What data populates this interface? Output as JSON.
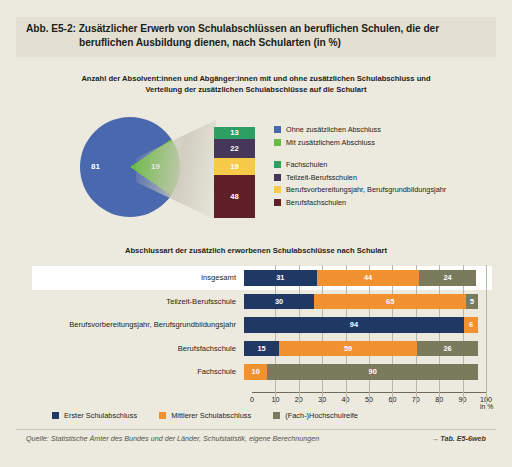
{
  "figure": {
    "label": "Abb. E5-2:",
    "title_line1": "Zusätzlicher Erwerb von Schulabschlüssen an beruflichen Schulen, die der",
    "title_line2": "beruflichen Ausbildung dienen, nach Schularten (in %)"
  },
  "upper": {
    "subtitle_line1": "Anzahl der Absolvent:innen und Abgänger:innen mit und ohne zusätzlichen Schulabschluss und",
    "subtitle_line2": "Verteilung der zusätzlichen Schulabschlüsse auf die Schulart",
    "legend": [
      {
        "label": "Ohne zusätzlichen Abschluss",
        "color": "#4a68ad"
      },
      {
        "label": "Mit zusätzlichem Abschluss",
        "color": "#6aba44"
      },
      {
        "label": "Fachschulen",
        "color": "#2f9e63"
      },
      {
        "label": "Teilzeit-Berufsschulen",
        "color": "#46375a"
      },
      {
        "label": "Berufsvorbereitungsjahr, Berufsgrundbildungsjahr",
        "color": "#f7c948"
      },
      {
        "label": "Berufsfachschulen",
        "color": "#5e1f28"
      }
    ]
  },
  "lower": {
    "subtitle": "Abschlussart der zusätzlich erworbenen Schulabschlüsse nach Schulart",
    "axis_unit": "in %",
    "legend": [
      {
        "label": "Erster Schulabschluss",
        "color": "#203864"
      },
      {
        "label": "Mittlerer Schulabschluss",
        "color": "#f2912f"
      },
      {
        "label": "(Fach-)Hochschulreife",
        "color": "#7a7a5c"
      }
    ]
  },
  "footer": {
    "source": "Quelle: Statistische Ämter des Bundes und der Länder, Schulstatistik, eigene Berechnungen",
    "table_ref": "→ Tab. E5-6web"
  },
  "chart_data": [
    {
      "type": "pie",
      "title": "Anzahl der Absolvent:innen und Abgänger:innen mit und ohne zusätzlichen Schulabschluss",
      "categories": [
        "Ohne zusätzlichen Abschluss",
        "Mit zusätzlichem Abschluss"
      ],
      "values": [
        81,
        19
      ],
      "colors": [
        "#4a68ad",
        "#6aba44"
      ],
      "unit": "%"
    },
    {
      "type": "bar",
      "orientation": "vertical-stacked",
      "title": "Verteilung der zusätzlichen Schulabschlüsse auf die Schulart",
      "categories": [
        "Fachschulen",
        "Teilzeit-Berufsschulen",
        "Berufsvorbereitungsjahr, Berufsgrundbildungsjahr",
        "Berufsfachschulen"
      ],
      "values": [
        13,
        22,
        19,
        48
      ],
      "colors": [
        "#2f9e63",
        "#46375a",
        "#f7c948",
        "#5e1f28"
      ],
      "unit": "%",
      "ylim": [
        0,
        102
      ]
    },
    {
      "type": "bar",
      "orientation": "horizontal-stacked",
      "title": "Abschlussart der zusätzlich erworbenen Schulabschlüsse nach Schulart",
      "categories": [
        "Insgesamt",
        "Teilzeit-Berufsschule",
        "Berufsvorbereitungsjahr, Berufsgrundbildungsjahr",
        "Berufsfachschule",
        "Fachschule"
      ],
      "series": [
        {
          "name": "Erster Schulabschluss",
          "color": "#203864",
          "values": [
            31,
            30,
            94,
            15,
            0
          ]
        },
        {
          "name": "Mittlerer Schulabschluss",
          "color": "#f2912f",
          "values": [
            44,
            65,
            6,
            59,
            10
          ]
        },
        {
          "name": "(Fach-)Hochschulreife",
          "color": "#7a7a5c",
          "values": [
            24,
            5,
            0,
            26,
            90
          ]
        }
      ],
      "xlabel": "in %",
      "ylabel": "",
      "xlim": [
        0,
        100
      ],
      "xticks": [
        0,
        10,
        20,
        30,
        40,
        50,
        60,
        70,
        80,
        90,
        100
      ],
      "grid": true,
      "legend_position": "bottom"
    }
  ]
}
